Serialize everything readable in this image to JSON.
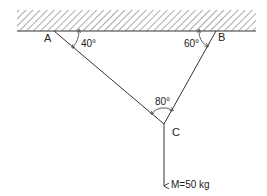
{
  "diagram": {
    "type": "statics-two-cable-suspension",
    "points": {
      "A": {
        "label": "A"
      },
      "B": {
        "label": "B"
      },
      "C": {
        "label": "C"
      }
    },
    "angles": {
      "at_A": "40°",
      "at_B": "60°",
      "at_C": "80°"
    },
    "load": {
      "label": "M=50 kg"
    },
    "colors": {
      "line": "#333333",
      "hatch": "#555555",
      "background": "#ffffff"
    }
  }
}
